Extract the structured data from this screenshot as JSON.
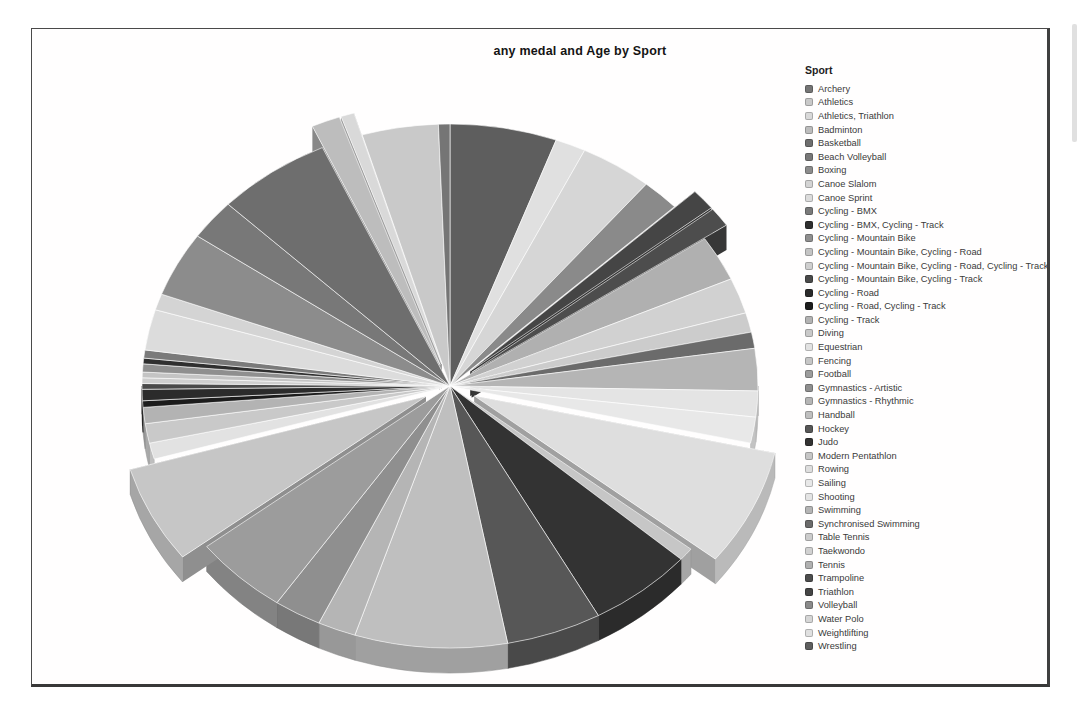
{
  "page": {
    "title": "any medal and Age by Sport"
  },
  "legend": {
    "title": "Sport",
    "position": "right"
  },
  "colors": {
    "background": "#ffffff",
    "frame_border": "#3f3f3f",
    "title_text": "#141414",
    "legend_text": "#3a3a3a",
    "slice_separator": "#ffffff"
  },
  "chart_data": {
    "type": "pie",
    "style": "3d",
    "title": "any medal and Age by Sport",
    "legend_title": "Sport",
    "legend_position": "right",
    "angle_field": "sum of Age (any medal)",
    "units_note": "slice values are percent of whole, estimated from slice angles in the figure",
    "order_note": "slices run alphabetically counter-clockwise from 12 o'clock",
    "slices": [
      {
        "label": "Archery",
        "value": 0.6,
        "color": "#757575",
        "exploded": false
      },
      {
        "label": "Athletics",
        "value": 4.0,
        "color": "#c9c9c9",
        "exploded": false
      },
      {
        "label": "Athletics, Triathlon",
        "value": 0.7,
        "color": "#d9d9d9",
        "exploded": true
      },
      {
        "label": "Badminton",
        "value": 1.5,
        "color": "#bdbdbd",
        "exploded": true
      },
      {
        "label": "Basketball",
        "value": 6.0,
        "color": "#6e6e6e",
        "exploded": false
      },
      {
        "label": "Beach Volleyball",
        "value": 2.5,
        "color": "#787878",
        "exploded": false
      },
      {
        "label": "Boxing",
        "value": 4.0,
        "color": "#8c8c8c",
        "exploded": false
      },
      {
        "label": "Canoe Slalom",
        "value": 1.0,
        "color": "#d4d4d4",
        "exploded": false
      },
      {
        "label": "Canoe Sprint",
        "value": 2.5,
        "color": "#dcdcdc",
        "exploded": false
      },
      {
        "label": "Cycling - BMX",
        "value": 0.5,
        "color": "#7a7a7a",
        "exploded": false
      },
      {
        "label": "Cycling - BMX, Cycling - Track",
        "value": 0.35,
        "color": "#2f2f2f",
        "exploded": false
      },
      {
        "label": "Cycling - Mountain Bike",
        "value": 0.5,
        "color": "#8f8f8f",
        "exploded": false
      },
      {
        "label": "Cycling - Mountain Bike, Cycling - Road",
        "value": 0.35,
        "color": "#c4c4c4",
        "exploded": false
      },
      {
        "label": "Cycling - Mountain Bike, Cycling - Road, Cycling - Track",
        "value": 0.35,
        "color": "#cfcfcf",
        "exploded": false
      },
      {
        "label": "Cycling - Mountain Bike, Cycling - Track",
        "value": 0.35,
        "color": "#4a4a4a",
        "exploded": false
      },
      {
        "label": "Cycling - Road",
        "value": 0.7,
        "color": "#2b2b2b",
        "exploded": false
      },
      {
        "label": "Cycling - Road, Cycling - Track",
        "value": 0.4,
        "color": "#1c1c1c",
        "exploded": false
      },
      {
        "label": "Cycling - Track",
        "value": 1.0,
        "color": "#b3b3b3",
        "exploded": false
      },
      {
        "label": "Diving",
        "value": 1.2,
        "color": "#c9c9c9",
        "exploded": false
      },
      {
        "label": "Equestrian",
        "value": 1.0,
        "color": "#e2e2e2",
        "exploded": false
      },
      {
        "label": "Fencing",
        "value": 6.0,
        "color": "#c6c6c6",
        "exploded": true
      },
      {
        "label": "Football",
        "value": 5.0,
        "color": "#9c9c9c",
        "exploded": false
      },
      {
        "label": "Gymnastics - Artistic",
        "value": 2.5,
        "color": "#8f8f8f",
        "exploded": false
      },
      {
        "label": "Gymnastics - Rhythmic",
        "value": 2.0,
        "color": "#b5b5b5",
        "exploded": false
      },
      {
        "label": "Handball",
        "value": 8.0,
        "color": "#bfbfbf",
        "exploded": false
      },
      {
        "label": "Hockey",
        "value": 5.0,
        "color": "#575757",
        "exploded": false
      },
      {
        "label": "Judo",
        "value": 5.5,
        "color": "#333333",
        "exploded": false
      },
      {
        "label": "Modern Pentathlon",
        "value": 0.8,
        "color": "#c6c6c6",
        "exploded": false
      },
      {
        "label": "Rowing",
        "value": 7.2,
        "color": "#dedede",
        "exploded": true
      },
      {
        "label": "Sailing",
        "value": 1.6,
        "color": "#e8e8e8",
        "exploded": false
      },
      {
        "label": "Shooting",
        "value": 1.6,
        "color": "#e4e4e4",
        "exploded": false
      },
      {
        "label": "Swimming",
        "value": 2.6,
        "color": "#b5b5b5",
        "exploded": false
      },
      {
        "label": "Synchronised Swimming",
        "value": 1.0,
        "color": "#6b6b6b",
        "exploded": false
      },
      {
        "label": "Table Tennis",
        "value": 1.2,
        "color": "#cccccc",
        "exploded": false
      },
      {
        "label": "Taekwondo",
        "value": 2.2,
        "color": "#d1d1d1",
        "exploded": false
      },
      {
        "label": "Tennis",
        "value": 2.8,
        "color": "#b0b0b0",
        "exploded": false
      },
      {
        "label": "Trampoline",
        "value": 1.2,
        "color": "#4d4d4d",
        "exploded": true
      },
      {
        "label": "Triathlon",
        "value": 1.3,
        "color": "#454545",
        "exploded": true
      },
      {
        "label": "Volleyball",
        "value": 2.0,
        "color": "#8a8a8a",
        "exploded": false
      },
      {
        "label": "Water Polo",
        "value": 3.8,
        "color": "#d6d6d6",
        "exploded": false
      },
      {
        "label": "Weightlifting",
        "value": 1.6,
        "color": "#e0e0e0",
        "exploded": false
      },
      {
        "label": "Wrestling",
        "value": 5.6,
        "color": "#5e5e5e",
        "exploded": false
      }
    ],
    "geometry": {
      "cx": 450,
      "cy": 386,
      "rx": 308,
      "ry": 262,
      "depth": 25,
      "explode_distance": 27
    }
  }
}
